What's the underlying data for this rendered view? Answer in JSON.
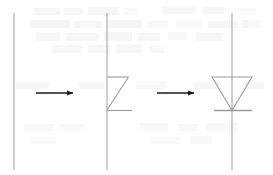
{
  "figure": {
    "type": "line-drawing",
    "width": 273,
    "height": 175,
    "background_color": "#ffffff",
    "paper_artifact": "faint grey bleed-through text from reverse side of scanned page, illegible"
  },
  "colors": {
    "construction_line": "#a8a8a8",
    "symbol_line": "#9a9a9a",
    "arrow": "#1a1a1a",
    "background": "#ffffff",
    "bleed_text": "#efefef"
  },
  "stages": [
    {
      "id": "stage-1",
      "label": "bare vertical wire",
      "caption": "1",
      "vertical_line": {
        "x": 14,
        "y_top": 13,
        "y_bottom": 170
      },
      "has_triangle": false,
      "has_cathode_bar": false
    },
    {
      "id": "stage-2",
      "label": "partial triangle: top edge, hypotenuse and base",
      "caption": "2",
      "vertical_line": {
        "x": 107,
        "y_top": 13,
        "y_bottom": 170
      },
      "top_edge": {
        "x1": 107,
        "y1": 77,
        "x2": 128,
        "y2": 77
      },
      "diagonal": {
        "x1": 128,
        "y1": 77,
        "x2": 107,
        "y2": 110
      },
      "base_edge": {
        "x1": 107,
        "y1": 110,
        "x2": 132,
        "y2": 110
      },
      "has_triangle": false,
      "has_cathode_bar": false
    },
    {
      "id": "stage-3",
      "label": "completed diode symbol: downward triangle plus cathode bar",
      "caption": "3",
      "vertical_line": {
        "x": 232,
        "y_top": 13,
        "y_bottom": 170
      },
      "triangle": {
        "apex": {
          "x": 232,
          "y": 110
        },
        "top_left": {
          "x": 212,
          "y": 77
        },
        "top_right": {
          "x": 252,
          "y": 77
        }
      },
      "cathode_bar": {
        "x1": 214,
        "y1": 110,
        "x2": 252,
        "y2": 110
      },
      "has_triangle": true,
      "has_cathode_bar": true
    }
  ],
  "arrows": [
    {
      "id": "arrow-1",
      "label": "transition from stage 1 to stage 2",
      "direction": "right",
      "x_start": 36,
      "x_end": 75,
      "y": 93
    },
    {
      "id": "arrow-2",
      "label": "transition from stage 2 to stage 3",
      "direction": "right",
      "x_start": 157,
      "x_end": 196,
      "y": 93
    }
  ]
}
